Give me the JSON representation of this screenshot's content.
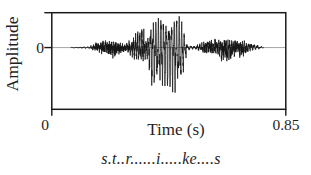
{
  "window": {
    "width": 311,
    "height": 175,
    "background": "#ffffff"
  },
  "colors": {
    "axis": "#1a1a1a",
    "zero_line": "#9b9b9b",
    "waveform": "#141414",
    "text": "#1f1f1f"
  },
  "chart_data": {
    "type": "line",
    "title": "",
    "xlabel": "Time (s)",
    "ylabel": "Amplitude",
    "xlim": [
      0,
      0.85
    ],
    "ylim": [
      -1.08,
      0.61
    ],
    "x_ticks": [
      {
        "value": 0,
        "label": "0"
      },
      {
        "value": 0.85,
        "label": "0.85"
      }
    ],
    "y_ticks": [
      {
        "value": 0,
        "label": "0"
      }
    ],
    "grid": false,
    "legend": false,
    "annotation": "s.t..r......i.....ke....s",
    "series": [
      {
        "name": "speech waveform",
        "signal_span_s": [
          0.069,
          0.77
        ],
        "envelope_units": "relative amplitude (1.0 = largest negative excursion shown)",
        "envelope_point_format": [
          "time_s",
          "positive_envelope",
          "negative_envelope",
          "oscillation_hz",
          "noise_fraction"
        ],
        "envelope_points": [
          [
            0.069,
            0.01,
            0.01,
            60,
            0.25
          ],
          [
            0.135,
            0.02,
            0.02,
            80,
            0.3
          ],
          [
            0.16,
            0.1,
            0.09,
            120,
            0.5
          ],
          [
            0.195,
            0.19,
            0.15,
            120,
            0.55
          ],
          [
            0.225,
            0.14,
            0.23,
            135,
            0.6
          ],
          [
            0.268,
            0.07,
            0.09,
            120,
            0.5
          ],
          [
            0.289,
            0.25,
            0.18,
            130,
            0.4
          ],
          [
            0.311,
            0.42,
            0.28,
            130,
            0.35
          ],
          [
            0.333,
            0.39,
            0.32,
            130,
            0.35
          ],
          [
            0.348,
            0.21,
            0.25,
            130,
            0.3
          ],
          [
            0.36,
            0.53,
            0.79,
            106,
            0.12
          ],
          [
            0.385,
            0.6,
            0.91,
            106,
            0.12
          ],
          [
            0.415,
            0.56,
            0.84,
            106,
            0.12
          ],
          [
            0.445,
            0.61,
            0.98,
            106,
            0.12
          ],
          [
            0.47,
            0.58,
            0.88,
            106,
            0.12
          ],
          [
            0.48,
            0.35,
            0.49,
            106,
            0.15
          ],
          [
            0.492,
            0.05,
            0.05,
            80,
            0.3
          ],
          [
            0.52,
            0.035,
            0.035,
            80,
            0.3
          ],
          [
            0.535,
            0.07,
            0.09,
            120,
            0.4
          ],
          [
            0.56,
            0.14,
            0.14,
            150,
            0.55
          ],
          [
            0.6,
            0.18,
            0.16,
            150,
            0.55
          ],
          [
            0.638,
            0.16,
            0.39,
            150,
            0.5
          ],
          [
            0.66,
            0.18,
            0.21,
            150,
            0.55
          ],
          [
            0.69,
            0.16,
            0.25,
            150,
            0.5
          ],
          [
            0.715,
            0.11,
            0.09,
            120,
            0.4
          ],
          [
            0.735,
            0.09,
            0.05,
            90,
            0.35
          ],
          [
            0.755,
            0.035,
            0.035,
            70,
            0.3
          ],
          [
            0.77,
            0.01,
            0.01,
            60,
            0.2
          ]
        ]
      }
    ]
  }
}
